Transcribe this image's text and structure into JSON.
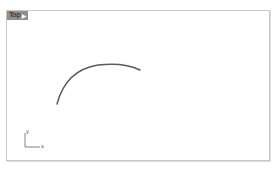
{
  "viewport": {
    "name": "Top",
    "menu_icon": "dropdown-arrow-icon",
    "border_color": "#c8c8c8",
    "tab_bg": "#8f8f8f"
  },
  "axes": {
    "x_label": "x",
    "y_label": "y",
    "color": "#555555"
  },
  "curve": {
    "type": "arc",
    "color": "#555555",
    "start": [
      57,
      104
    ],
    "end": [
      140,
      70
    ]
  }
}
